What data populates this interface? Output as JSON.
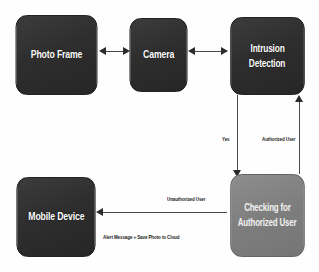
{
  "diagram": {
    "background_color": "#fefefe",
    "dark_node_color": "#2e2e2e",
    "light_node_color": "#7e7e7e",
    "edge_color": "#4a4a4a",
    "nodes": [
      {
        "id": "photo_frame",
        "label": "Photo Frame",
        "style": "dark"
      },
      {
        "id": "camera",
        "label": "Camera",
        "style": "dark"
      },
      {
        "id": "intrusion",
        "label_line1": "Intrusion",
        "label_line2": "Detection",
        "style": "dark"
      },
      {
        "id": "mobile",
        "label": "Mobile Device",
        "style": "dark"
      },
      {
        "id": "checking",
        "label_line1": "Checking for",
        "label_line2": "Authorized User",
        "style": "light"
      }
    ],
    "edges": [
      {
        "id": "photo_camera",
        "from": "photo_frame",
        "to": "camera",
        "label": "",
        "direction": "both"
      },
      {
        "id": "camera_intrusion",
        "from": "camera",
        "to": "intrusion",
        "label": "",
        "direction": "both"
      },
      {
        "id": "intrusion_check",
        "from": "intrusion",
        "to": "checking",
        "label": "Yes",
        "direction": "down"
      },
      {
        "id": "check_intrusion",
        "from": "checking",
        "to": "intrusion",
        "label": "Authorized User",
        "direction": "up"
      },
      {
        "id": "check_mobile",
        "from": "checking",
        "to": "mobile",
        "label": "Unauthorized User",
        "sublabel": "Alert Message + Save Photo to Cloud",
        "direction": "left"
      }
    ]
  }
}
